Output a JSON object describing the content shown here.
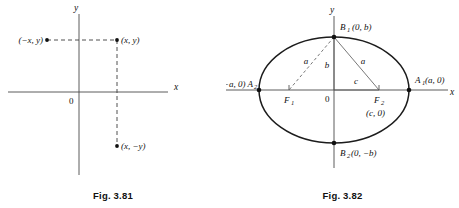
{
  "figures": [
    {
      "id": "fig-3-81",
      "caption": "Fig. 3.81",
      "axes": {
        "x_label": "x",
        "y_label": "y",
        "origin_label": "0"
      },
      "points": [
        {
          "name": "point-neg-x-y",
          "label": "(−x, y)"
        },
        {
          "name": "point-x-y",
          "label": "(x, y)"
        },
        {
          "name": "point-x-neg-y",
          "label": "(x, −y)"
        }
      ],
      "connectors": [
        {
          "name": "horizontal-dashed-connector",
          "style": "dashed"
        },
        {
          "name": "vertical-dashed-connector",
          "style": "dashed"
        }
      ]
    },
    {
      "id": "fig-3-82",
      "caption": "Fig. 3.82",
      "axes": {
        "x_label": "x",
        "y_label": "y",
        "origin_label": "0"
      },
      "vertices": [
        {
          "name": "vertex-a1",
          "symbol": "A",
          "subscript": "1",
          "coords": "(a, 0)",
          "label": "A₁(a, 0)"
        },
        {
          "name": "vertex-a2",
          "symbol": "A",
          "subscript": "2",
          "coords": "(−a, 0)",
          "label": "(−a, 0) A₂"
        },
        {
          "name": "vertex-b1",
          "symbol": "B",
          "subscript": "1",
          "coords": "(0, b)",
          "label": "B₁ (0, b)"
        },
        {
          "name": "vertex-b2",
          "symbol": "B",
          "subscript": "2",
          "coords": "(0, −b)",
          "label": "B₂(0, −b)"
        }
      ],
      "foci": [
        {
          "name": "focus-f1",
          "symbol": "F",
          "subscript": "1",
          "coords": ""
        },
        {
          "name": "focus-f2",
          "symbol": "F",
          "subscript": "2",
          "coords": "(c, 0)"
        }
      ],
      "segments": [
        {
          "name": "segment-a-left",
          "label": "a",
          "style": "dashed"
        },
        {
          "name": "segment-b",
          "label": "b",
          "style": "solid"
        },
        {
          "name": "segment-a-right",
          "label": "a",
          "style": "solid"
        },
        {
          "name": "segment-c",
          "label": "c",
          "style": "solid"
        }
      ]
    }
  ],
  "text": {
    "a2_left_part": "(−a, 0) A",
    "a2_sub": "2",
    "a1_symbol": "A",
    "a1_sub": "1",
    "a1_coords": "(a, 0)",
    "b1_symbol": "B",
    "b1_sub": "1",
    "b1_coords": "(0, b)",
    "b2_symbol": "B",
    "b2_sub": "2",
    "b2_coords": "(0, −b)",
    "f1_symbol": "F",
    "f1_sub": "1",
    "f2_symbol": "F",
    "f2_sub": "2",
    "f2_coords": "(c, 0)"
  }
}
